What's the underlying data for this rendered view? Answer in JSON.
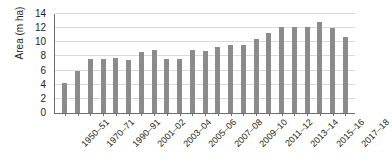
{
  "chart_data": {
    "type": "bar",
    "title": "",
    "subtitle": "",
    "xlabel": "",
    "ylabel": "Area (m ha)",
    "ylim": [
      0,
      14
    ],
    "ytick_values": [
      0,
      2,
      4,
      6,
      8,
      10,
      12,
      14
    ],
    "ytick_labels": [
      "0",
      "2",
      "4",
      "6",
      "8",
      "10",
      "12",
      "14"
    ],
    "grid": "horizontal",
    "legend": "none",
    "bar_color": "#8b8b8b",
    "axis_color": "#6d6e71",
    "grid_color": "#d9dadb",
    "text_color": "#231f20",
    "categories": [
      "1950–51",
      "1960–61",
      "1970–71",
      "1980–81",
      "1990–91",
      "2000–01",
      "2001–02",
      "2002–03",
      "2003–04",
      "2004–05",
      "2005–06",
      "2006–07",
      "2007–08",
      "2008–09",
      "2009–10",
      "2010–11",
      "2011–12",
      "2012–13",
      "2013–14",
      "2014–15",
      "2015–16",
      "2016–17",
      "2017–18"
    ],
    "values": [
      4.3,
      5.9,
      7.6,
      7.6,
      7.8,
      7.5,
      8.6,
      8.9,
      7.7,
      7.7,
      8.9,
      8.8,
      9.3,
      9.6,
      9.6,
      10.5,
      11.3,
      12.2,
      12.1,
      12.1,
      12.9,
      12.0,
      10.7
    ],
    "visible_xtick_labels": [
      "1950–51",
      "1970–71",
      "1990–91",
      "2001–02",
      "2003–04",
      "2005–06",
      "2007–08",
      "2009–10",
      "2011–12",
      "2013–14",
      "2015–16",
      "2017–18"
    ],
    "extra_values": [
      12.6,
      12.7
    ],
    "extra_categories": [
      "2016–17",
      "2017–18"
    ]
  }
}
